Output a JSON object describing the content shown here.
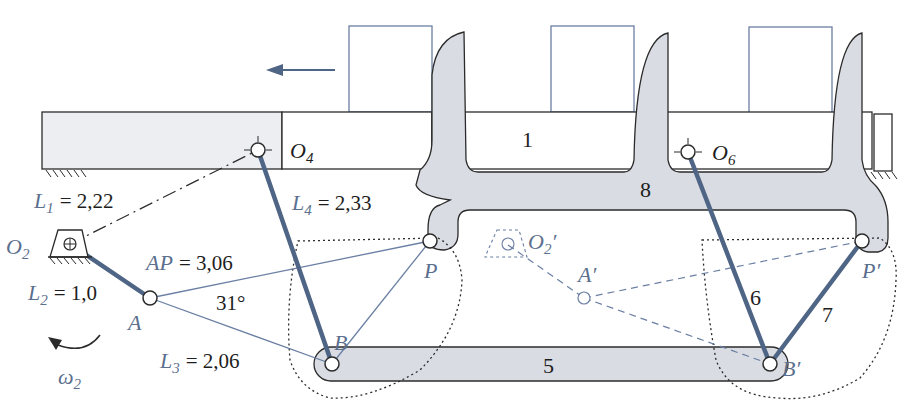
{
  "figure": {
    "type": "linkage-mechanism-diagram",
    "colors": {
      "link_blue": "#4f6585",
      "thin_blue": "#6a7fa3",
      "label_blue": "#5b6f8e",
      "body_fill": "#d9dce2",
      "body_stroke": "#2b2b2b",
      "box_stroke": "#6a7fa3",
      "ground_fill": "#eceef2",
      "text": "#1e1e1e"
    },
    "direction_arrow": "left-arrow",
    "labels": {
      "O2": "O",
      "O2_sub": "2",
      "O4": "O",
      "O4_sub": "4",
      "O6": "O",
      "O6_sub": "6",
      "O2p": "O",
      "O2p_sub": "2",
      "O2p_prime": "′",
      "A": "A",
      "Ap": "A′",
      "B": "B",
      "Bp": "B′",
      "P": "P",
      "Pp": "P′",
      "omega": "ω",
      "omega_sub": "2"
    },
    "dimensions": {
      "L1": {
        "name": "L",
        "sub": "1",
        "value": "= 2,22"
      },
      "L2": {
        "name": "L",
        "sub": "2",
        "value": "= 1,0"
      },
      "L3": {
        "name": "L",
        "sub": "3",
        "value": "= 2,06"
      },
      "L4": {
        "name": "L",
        "sub": "4",
        "value": "= 2,33"
      },
      "AP": {
        "name": "AP",
        "value": "= 3,06"
      },
      "angle": "31°"
    },
    "link_numbers": {
      "ground": "1",
      "coupler": "5",
      "rocker": "6",
      "link7": "7",
      "frame": "8"
    }
  }
}
